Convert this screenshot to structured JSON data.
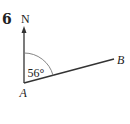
{
  "question": {
    "number": "6"
  },
  "diagram": {
    "north_label": "N",
    "point_a_label": "A",
    "point_b_label": "B",
    "angle_label": "56°",
    "angle_degrees": 56,
    "line_color": "#333333",
    "arc_color": "#666666"
  }
}
